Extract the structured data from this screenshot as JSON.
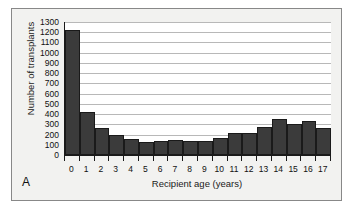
{
  "figure": {
    "panel_label": "A",
    "background_color": "#f2f2f0",
    "plot_background_color": "#ffffff",
    "frame_color": "#888888"
  },
  "chart_data": {
    "type": "bar",
    "title": "",
    "subtitle": "",
    "xlabel": "Recipient age (years)",
    "ylabel": "Number of transplants",
    "categories": [
      "0",
      "1",
      "2",
      "3",
      "4",
      "5",
      "6",
      "7",
      "8",
      "9",
      "10",
      "11",
      "12",
      "13",
      "14",
      "15",
      "16",
      "17"
    ],
    "values": [
      1220,
      420,
      265,
      200,
      155,
      128,
      135,
      142,
      135,
      140,
      165,
      220,
      212,
      270,
      350,
      300,
      328,
      262
    ],
    "ylim": [
      0,
      1300
    ],
    "ytick_step": 100,
    "ytick_labels": [
      "1300",
      "1200",
      "1100",
      "1000",
      "900",
      "800",
      "700",
      "600",
      "500",
      "400",
      "300",
      "200",
      "100",
      "0"
    ],
    "ytick_values": [
      1300,
      1200,
      1100,
      1000,
      900,
      800,
      700,
      600,
      500,
      400,
      300,
      200,
      100,
      0
    ],
    "grid": true,
    "grid_color": "#b8b8b8",
    "bar_color": "#3b3b3b",
    "bar_edge_color": "#1a1a1a",
    "axis_color": "#1a1a1a",
    "legend": null,
    "legend_position": "none",
    "annotations": []
  }
}
